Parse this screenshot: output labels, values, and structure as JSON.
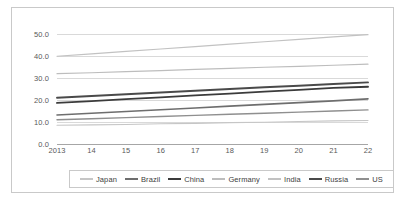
{
  "chart_data": {
    "type": "line",
    "title": "",
    "xlabel": "",
    "ylabel": "",
    "grid": true,
    "legend_position": "bottom",
    "x": [
      2013,
      2014,
      2015,
      2016,
      2017,
      2018,
      2019,
      2020,
      2021,
      2022
    ],
    "xtick_labels": [
      "2013",
      "14",
      "15",
      "16",
      "17",
      "18",
      "19",
      "20",
      "21",
      "22"
    ],
    "ytick_labels": [
      "0.0",
      "10.0",
      "20.0",
      "30.0",
      "40.0",
      "50.0"
    ],
    "yticks": [
      0.0,
      10.0,
      20.0,
      30.0,
      40.0,
      50.0
    ],
    "ylim": [
      0.0,
      53.2
    ],
    "series": [
      {
        "name": "Japan",
        "color": "#c6c6c6",
        "width": 1.1,
        "values": [
          8.5,
          8.7,
          8.9,
          9.2,
          9.4,
          9.7,
          9.9,
          10.2,
          10.5,
          10.7
        ]
      },
      {
        "name": "Brazil",
        "color": "#6e6e6e",
        "width": 1.6,
        "values": [
          13.2,
          14.0,
          14.8,
          15.6,
          16.4,
          17.2,
          18.0,
          18.8,
          19.6,
          20.5
        ]
      },
      {
        "name": "China",
        "color": "#3b3b3b",
        "width": 1.9,
        "values": [
          18.7,
          19.5,
          20.4,
          21.2,
          22.1,
          22.9,
          23.8,
          24.6,
          25.5,
          26.0
        ]
      },
      {
        "name": "Germany",
        "color": "#bdbdbd",
        "width": 1.2,
        "values": [
          32.0,
          32.4,
          32.9,
          33.4,
          33.9,
          34.4,
          34.9,
          35.3,
          35.8,
          36.3
        ]
      },
      {
        "name": "India",
        "color": "#c2c2c2",
        "width": 1.2,
        "values": [
          39.9,
          41.0,
          42.1,
          43.2,
          44.3,
          45.4,
          46.5,
          47.6,
          48.7,
          49.7
        ]
      },
      {
        "name": "Russia",
        "color": "#4a4a4a",
        "width": 1.9,
        "values": [
          21.0,
          21.8,
          22.6,
          23.4,
          24.2,
          25.0,
          25.8,
          26.5,
          27.3,
          28.0
        ]
      },
      {
        "name": "US",
        "color": "#8f8f8f",
        "width": 1.4,
        "values": [
          11.0,
          11.5,
          12.0,
          12.5,
          13.0,
          13.5,
          14.0,
          14.5,
          15.0,
          15.5
        ]
      }
    ]
  }
}
